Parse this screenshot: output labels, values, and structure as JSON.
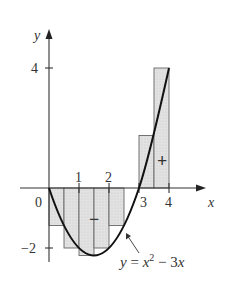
{
  "figure": {
    "function_label": "y = x² − 3x",
    "function_label_parts": {
      "y": "y",
      "eq": " = ",
      "x": "x",
      "exp": "2",
      "rest": " − 3",
      "x2": "x"
    },
    "axis_x_label": "x",
    "axis_y_label": "y",
    "origin_label": "0",
    "x_ticks": [
      {
        "value": 1,
        "label": "1"
      },
      {
        "value": 2,
        "label": "2"
      },
      {
        "value": 3,
        "label": "3"
      },
      {
        "value": 4,
        "label": "4"
      }
    ],
    "y_ticks": [
      {
        "value": 4,
        "label": "4"
      },
      {
        "value": -2,
        "label": "−2"
      }
    ],
    "sign_negative": "−",
    "sign_positive": "+",
    "rectangles": [
      {
        "x0": 0.0,
        "x1": 0.5,
        "height": -1.25
      },
      {
        "x0": 0.5,
        "x1": 1.0,
        "height": -2.0
      },
      {
        "x0": 1.0,
        "x1": 1.5,
        "height": -2.25
      },
      {
        "x0": 1.5,
        "x1": 2.0,
        "height": -2.0
      },
      {
        "x0": 2.0,
        "x1": 2.5,
        "height": -1.25
      },
      {
        "x0": 2.5,
        "x1": 3.0,
        "height": 0.0
      },
      {
        "x0": 3.0,
        "x1": 3.5,
        "height": 1.75
      },
      {
        "x0": 3.5,
        "x1": 4.0,
        "height": 4.0
      }
    ],
    "colors": {
      "fill": "#dcdcdc",
      "stroke": "#555555",
      "curve": "#111111",
      "axis": "#333333"
    }
  }
}
